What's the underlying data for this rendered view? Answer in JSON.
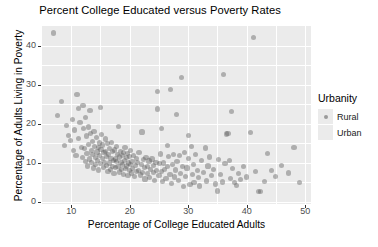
{
  "chart_data": {
    "type": "scatter",
    "title": "Percent College Educated versus Poverty Rates",
    "xlabel": "Percentage of College Educated Adults",
    "ylabel": "Percentage of Adults Living in Poverty",
    "xlim": [
      5,
      51
    ],
    "ylim": [
      -0.5,
      45
    ],
    "xticks": [
      10,
      20,
      30,
      40,
      50
    ],
    "yticks": [
      0,
      10,
      20,
      30,
      40
    ],
    "xtick_labels": [
      "10",
      "20",
      "30",
      "40",
      "50"
    ],
    "ytick_labels": [
      "0",
      "10",
      "20",
      "30",
      "40"
    ],
    "grid": true,
    "grid_major_x": [
      10,
      20,
      30,
      40,
      50
    ],
    "grid_minor_x": [
      15,
      25,
      35,
      45
    ],
    "grid_major_y": [
      0,
      10,
      20,
      30,
      40
    ],
    "grid_minor_y": [
      5,
      15,
      25,
      35
    ],
    "panel_background": "#ebebeb",
    "grid_color": "#ffffff",
    "point_color": "#5a5a5a",
    "point_opacity": 0.42,
    "legend": {
      "title": "Urbanity",
      "position": "right",
      "entries": [
        {
          "label": "Rural",
          "marker": "point",
          "color": "#5a5a5a"
        },
        {
          "label": "Urban",
          "marker": "square",
          "color": "#5a5a5a"
        }
      ]
    },
    "series": [
      {
        "name": "Counties",
        "points": [
          [
            7.0,
            43.2
          ],
          [
            7.6,
            22.1
          ],
          [
            8.3,
            25.8
          ],
          [
            8.8,
            14.5
          ],
          [
            9.2,
            19.6
          ],
          [
            9.6,
            17.1
          ],
          [
            9.9,
            15.8
          ],
          [
            10.2,
            21.1
          ],
          [
            10.4,
            13.2
          ],
          [
            10.6,
            18.4
          ],
          [
            10.8,
            12.0
          ],
          [
            11.0,
            27.4
          ],
          [
            11.2,
            23.9
          ],
          [
            11.3,
            16.2
          ],
          [
            11.5,
            20.3
          ],
          [
            11.7,
            14.0
          ],
          [
            11.9,
            11.4
          ],
          [
            12.0,
            24.6
          ],
          [
            12.1,
            18.8
          ],
          [
            12.3,
            13.6
          ],
          [
            12.4,
            10.4
          ],
          [
            12.5,
            21.6
          ],
          [
            12.6,
            16.9
          ],
          [
            12.7,
            12.4
          ],
          [
            12.8,
            9.2
          ],
          [
            12.9,
            19.2
          ],
          [
            13.0,
            14.7
          ],
          [
            13.1,
            11.0
          ],
          [
            13.2,
            23.3
          ],
          [
            13.3,
            17.6
          ],
          [
            13.4,
            13.1
          ],
          [
            13.5,
            10.1
          ],
          [
            13.6,
            15.4
          ],
          [
            13.7,
            12.2
          ],
          [
            13.8,
            8.7
          ],
          [
            13.9,
            18.1
          ],
          [
            14.0,
            14.3
          ],
          [
            14.1,
            11.3
          ],
          [
            14.2,
            9.6
          ],
          [
            14.3,
            16.4
          ],
          [
            14.4,
            12.8
          ],
          [
            14.5,
            10.6
          ],
          [
            14.6,
            13.9
          ],
          [
            14.7,
            8.2
          ],
          [
            14.8,
            15.1
          ],
          [
            14.9,
            11.8
          ],
          [
            15.0,
            24.1
          ],
          [
            15.0,
            9.9
          ],
          [
            15.1,
            13.4
          ],
          [
            15.2,
            17.2
          ],
          [
            15.3,
            11.1
          ],
          [
            15.4,
            14.6
          ],
          [
            15.5,
            8.9
          ],
          [
            15.6,
            12.6
          ],
          [
            15.7,
            10.2
          ],
          [
            15.8,
            16.1
          ],
          [
            15.9,
            13.0
          ],
          [
            16.0,
            9.4
          ],
          [
            16.1,
            11.6
          ],
          [
            16.2,
            14.9
          ],
          [
            16.3,
            7.9
          ],
          [
            16.4,
            12.1
          ],
          [
            16.5,
            10.0
          ],
          [
            16.6,
            13.7
          ],
          [
            16.7,
            8.4
          ],
          [
            16.8,
            11.2
          ],
          [
            16.9,
            15.3
          ],
          [
            17.0,
            9.1
          ],
          [
            17.1,
            12.9
          ],
          [
            17.2,
            10.7
          ],
          [
            17.3,
            7.3
          ],
          [
            17.4,
            13.3
          ],
          [
            17.5,
            11.0
          ],
          [
            17.6,
            8.8
          ],
          [
            17.7,
            14.2
          ],
          [
            17.8,
            10.3
          ],
          [
            17.9,
            12.2
          ],
          [
            18.0,
            9.0
          ],
          [
            18.1,
            19.3
          ],
          [
            18.2,
            11.5
          ],
          [
            18.3,
            7.7
          ],
          [
            18.4,
            13.0
          ],
          [
            18.5,
            10.1
          ],
          [
            18.6,
            8.3
          ],
          [
            18.7,
            11.9
          ],
          [
            18.8,
            9.5
          ],
          [
            18.9,
            12.7
          ],
          [
            19.0,
            7.1
          ],
          [
            19.1,
            10.6
          ],
          [
            19.2,
            14.0
          ],
          [
            19.3,
            8.6
          ],
          [
            19.4,
            11.3
          ],
          [
            19.5,
            9.2
          ],
          [
            19.6,
            12.4
          ],
          [
            19.7,
            6.8
          ],
          [
            19.8,
            10.0
          ],
          [
            19.9,
            8.0
          ],
          [
            20.0,
            11.7
          ],
          [
            20.1,
            9.7
          ],
          [
            20.2,
            13.1
          ],
          [
            20.3,
            7.4
          ],
          [
            20.4,
            10.4
          ],
          [
            20.5,
            8.5
          ],
          [
            20.6,
            12.0
          ],
          [
            20.8,
            6.5
          ],
          [
            21.0,
            9.3
          ],
          [
            21.1,
            11.1
          ],
          [
            21.2,
            7.8
          ],
          [
            21.4,
            10.2
          ],
          [
            21.5,
            8.1
          ],
          [
            21.6,
            12.6
          ],
          [
            21.8,
            6.9
          ],
          [
            22.0,
            9.6
          ],
          [
            22.1,
            17.9
          ],
          [
            22.2,
            7.5
          ],
          [
            22.4,
            10.8
          ],
          [
            22.5,
            8.8
          ],
          [
            22.6,
            5.9
          ],
          [
            22.8,
            11.4
          ],
          [
            23.0,
            7.2
          ],
          [
            23.1,
            9.0
          ],
          [
            23.3,
            10.5
          ],
          [
            23.4,
            6.3
          ],
          [
            23.6,
            8.3
          ],
          [
            23.8,
            11.0
          ],
          [
            24.0,
            7.6
          ],
          [
            24.1,
            9.4
          ],
          [
            24.3,
            5.6
          ],
          [
            24.5,
            10.1
          ],
          [
            24.6,
            8.0
          ],
          [
            24.7,
            28.3
          ],
          [
            24.8,
            23.8
          ],
          [
            25.0,
            6.7
          ],
          [
            25.1,
            9.8
          ],
          [
            25.2,
            12.3
          ],
          [
            25.4,
            7.9
          ],
          [
            25.5,
            18.9
          ],
          [
            25.6,
            5.2
          ],
          [
            25.8,
            10.0
          ],
          [
            26.0,
            8.4
          ],
          [
            26.2,
            6.1
          ],
          [
            26.4,
            14.4
          ],
          [
            26.5,
            9.1
          ],
          [
            26.7,
            11.6
          ],
          [
            26.9,
            7.0
          ],
          [
            27.0,
            28.7
          ],
          [
            27.1,
            4.8
          ],
          [
            27.3,
            9.5
          ],
          [
            27.5,
            12.1
          ],
          [
            27.6,
            6.4
          ],
          [
            27.8,
            8.2
          ],
          [
            28.0,
            22.4
          ],
          [
            28.1,
            10.3
          ],
          [
            28.3,
            5.5
          ],
          [
            28.5,
            11.8
          ],
          [
            28.7,
            7.3
          ],
          [
            28.9,
            31.8
          ],
          [
            29.0,
            9.0
          ],
          [
            29.2,
            3.9
          ],
          [
            29.4,
            12.7
          ],
          [
            29.6,
            6.6
          ],
          [
            29.8,
            8.7
          ],
          [
            30.0,
            17.0
          ],
          [
            30.1,
            11.2
          ],
          [
            30.3,
            4.4
          ],
          [
            30.5,
            14.1
          ],
          [
            30.7,
            7.1
          ],
          [
            30.9,
            9.6
          ],
          [
            31.0,
            5.0
          ],
          [
            31.3,
            12.2
          ],
          [
            31.6,
            8.0
          ],
          [
            31.8,
            6.2
          ],
          [
            32.0,
            4.1
          ],
          [
            32.3,
            10.6
          ],
          [
            32.6,
            7.5
          ],
          [
            32.9,
            13.8
          ],
          [
            33.1,
            5.4
          ],
          [
            33.4,
            9.2
          ],
          [
            33.7,
            11.5
          ],
          [
            34.0,
            6.8
          ],
          [
            34.3,
            8.3
          ],
          [
            34.6,
            4.6
          ],
          [
            35.0,
            2.8
          ],
          [
            35.2,
            10.9
          ],
          [
            35.5,
            7.0
          ],
          [
            35.8,
            5.1
          ],
          [
            36.1,
            32.7
          ],
          [
            36.3,
            9.8
          ],
          [
            36.6,
            17.4
          ],
          [
            36.8,
            17.6
          ],
          [
            37.0,
            10.6
          ],
          [
            37.2,
            6.0
          ],
          [
            37.4,
            23.2
          ],
          [
            37.6,
            8.5
          ],
          [
            37.9,
            4.9
          ],
          [
            38.2,
            4.2
          ],
          [
            38.6,
            7.2
          ],
          [
            39.0,
            5.8
          ],
          [
            39.5,
            9.0
          ],
          [
            40.0,
            6.4
          ],
          [
            40.6,
            17.8
          ],
          [
            41.2,
            42.0
          ],
          [
            41.5,
            7.8
          ],
          [
            42.0,
            2.6
          ],
          [
            42.4,
            2.7
          ],
          [
            43.0,
            5.3
          ],
          [
            43.6,
            12.5
          ],
          [
            44.2,
            8.1
          ],
          [
            45.0,
            6.6
          ],
          [
            46.0,
            9.3
          ],
          [
            47.2,
            7.4
          ],
          [
            48.1,
            13.9
          ],
          [
            49.0,
            5.0
          ]
        ]
      }
    ]
  }
}
